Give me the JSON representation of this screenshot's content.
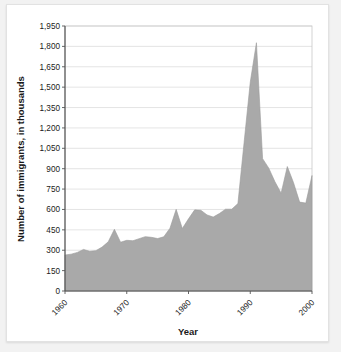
{
  "card": {
    "background_color": "#ffffff",
    "page_background_color": "#f2f2f2"
  },
  "chart_data": {
    "type": "area",
    "title": "",
    "subtitle": "",
    "xlabel": "Year",
    "ylabel": "Number of immigrants, in thousands",
    "xlim": [
      1960,
      2000
    ],
    "ylim": [
      0,
      1950
    ],
    "grid": true,
    "legend": false,
    "legend_position": "none",
    "series_color": "#a9a9a9",
    "ytick_labels": [
      "1,950",
      "1,800",
      "1,650",
      "1,500",
      "1,350",
      "1,200",
      "1,050",
      "900",
      "750",
      "600",
      "450",
      "300",
      "150",
      "0"
    ],
    "ytick_values": [
      1950,
      1800,
      1650,
      1500,
      1350,
      1200,
      1050,
      900,
      750,
      600,
      450,
      300,
      150,
      0
    ],
    "xtick_labels": [
      "1960",
      "1970",
      "1980",
      "1990",
      "2000"
    ],
    "xtick_values": [
      1960,
      1970,
      1980,
      1990,
      2000
    ],
    "xtick_rotation_degrees": -45,
    "x": [
      1960,
      1961,
      1962,
      1963,
      1964,
      1965,
      1966,
      1967,
      1968,
      1969,
      1970,
      1971,
      1972,
      1973,
      1974,
      1975,
      1976,
      1977,
      1978,
      1979,
      1980,
      1981,
      1982,
      1983,
      1984,
      1985,
      1986,
      1987,
      1988,
      1989,
      1990,
      1991,
      1992,
      1993,
      1994,
      1995,
      1996,
      1997,
      1998,
      1999,
      2000
    ],
    "values": [
      265,
      271,
      284,
      306,
      292,
      297,
      323,
      362,
      454,
      359,
      373,
      370,
      385,
      400,
      395,
      386,
      399,
      462,
      601,
      460,
      531,
      597,
      594,
      560,
      544,
      570,
      602,
      602,
      643,
      1091,
      1536,
      1827,
      974,
      904,
      804,
      720,
      916,
      798,
      654,
      647,
      850
    ],
    "annotations": []
  },
  "axis_titles": {
    "y": "Number of immigrants, in thousands",
    "x": "Year"
  }
}
